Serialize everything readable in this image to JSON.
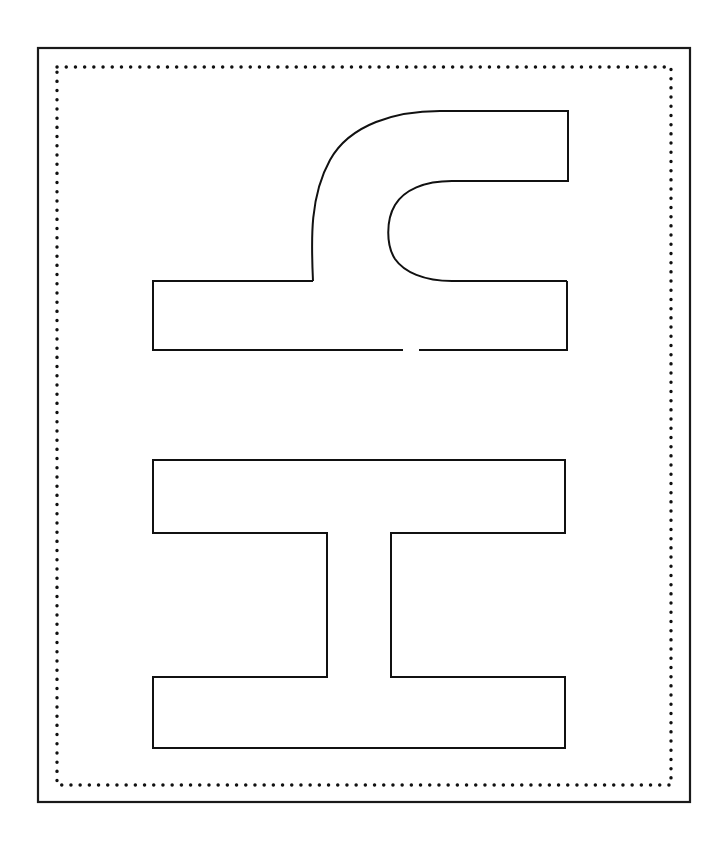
{
  "page": {
    "width": 725,
    "height": 841,
    "background_color": "#ffffff",
    "stroke_color": "#111111",
    "fill_color": "#ffffff"
  },
  "outer_frame": {
    "label": "outer rectangle border",
    "x": 38,
    "y": 48,
    "width": 652,
    "height": 754,
    "stroke_width": 2.2,
    "stroke_color": "#1a1a1a",
    "fill": "none"
  },
  "dotted_frame": {
    "label": "inner dotted rectangle border",
    "x": 57,
    "y": 67,
    "width": 614,
    "height": 718,
    "stroke_width": 3.4,
    "stroke_color": "#111111",
    "dash_pattern": "0.1 9.1",
    "line_cap": "round",
    "fill": "none"
  },
  "figure": {
    "label": "stencil outline glyph",
    "stroke_width": 2.0,
    "stroke_color": "#111111",
    "fill": "#ffffff",
    "parts": [
      {
        "name": "upper-hook",
        "description": "U-shaped hook curving from lower-left up over the top and back down into a rightward tongue",
        "path": "M 313 281 C 311 238 310 196 330 160 C 350 124 396 111 440 111 L 568 111 L 568 181 L 452 181 C 424 181 404 190 395 205 C 386 220 386 245 395 259 C 404 272 424 281 452 281 L 567 281"
      },
      {
        "name": "middle-bar-left-segment",
        "description": "left part of the wide horizontal bar under the hook, with a small gap in its bottom edge",
        "path": "M 313 281 L 153 281 L 153 350 L 403 350"
      },
      {
        "name": "middle-bar-right-segment",
        "description": "right part of the wide horizontal bar bottom edge resuming after the gap",
        "path": "M 419 350 L 567 350 L 567 281"
      },
      {
        "name": "gong-glyph",
        "description": "工 shaped outline: top bar, central stem, bottom bar",
        "path": "M 153 460 L 565 460 L 565 533 L 391 533 L 391 677 L 565 677 L 565 748 L 153 748 L 153 677 L 327 677 L 327 533 L 153 533 Z"
      }
    ]
  },
  "geometry_notes": {
    "hook_top_edge_y": 111,
    "hook_right_edge_x": 568,
    "hook_inner_edge_y": 181,
    "hook_outer_left_x": 313,
    "hook_inner_left_x": 388,
    "middle_bar_top_y": 281,
    "middle_bar_bottom_y": 350,
    "middle_bar_left_x": 153,
    "middle_bar_right_x": 567,
    "middle_bar_gap_start_x": 403,
    "middle_bar_gap_end_x": 419,
    "gong_top_bar_top_y": 460,
    "gong_top_bar_bottom_y": 533,
    "gong_stem_left_x": 327,
    "gong_stem_right_x": 391,
    "gong_bottom_bar_top_y": 677,
    "gong_bottom_bar_bottom_y": 748,
    "gong_left_x": 153,
    "gong_right_x": 565
  }
}
